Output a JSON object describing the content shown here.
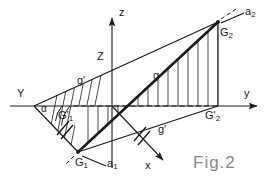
{
  "figure": {
    "caption": "Fig.2",
    "background_color": "#ffffff",
    "ink_color": "#1a1a1a",
    "caption_color": "#8a8a8a"
  },
  "axes": [
    {
      "name": "z-axis",
      "label": "z",
      "direction": "up"
    },
    {
      "name": "y-axis",
      "label": "y",
      "direction": "right"
    },
    {
      "name": "x-axis",
      "label": "x",
      "direction": "down-right"
    },
    {
      "name": "Y-axis-left",
      "label": "Y",
      "direction": "left"
    }
  ],
  "labels": {
    "axis_z": "z",
    "axis_y": "y",
    "axis_x": "x",
    "axis_Y": "Y",
    "height_Z": "Z",
    "angle_alpha": "α",
    "line_g": "g",
    "line_g_prime_upper": "g'",
    "line_g_prime_lower": "g'",
    "point_G1": "G",
    "point_G1_sub": "1",
    "point_G2": "G",
    "point_G2_sub": "2",
    "point_G1_prime": "G",
    "point_G1_prime_sub": "1",
    "point_G1_prime_mark": "'",
    "point_G2_prime": "G",
    "point_G2_prime_sub": "2",
    "point_G2_prime_mark": "'",
    "trace_a1": "a",
    "trace_a1_sub": "1",
    "trace_a2": "a",
    "trace_a2_sub": "2"
  },
  "geometry": {
    "origin": [
      112,
      106
    ],
    "Y_vertex": [
      34,
      106
    ],
    "G1": [
      78,
      152
    ],
    "G2": [
      218,
      22
    ],
    "G1_prime": [
      73,
      106
    ],
    "G2_prime": [
      218,
      106
    ],
    "z_axis_top": [
      112,
      14
    ],
    "y_axis_right": [
      262,
      106
    ],
    "x_axis_end": [
      168,
      164
    ],
    "hatch_count_vertical": 14,
    "hatch_count_slanted": 6
  }
}
